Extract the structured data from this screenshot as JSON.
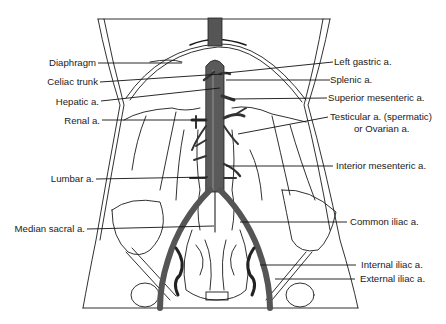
{
  "diagram": {
    "colors": {
      "line": "#1a1a1a",
      "artery": "#555555",
      "artery_dark": "#2a2a2a",
      "background": "#ffffff"
    },
    "labels_left": [
      {
        "text": "Diaphragm"
      },
      {
        "text": "Celiac trunk"
      },
      {
        "text": "Hepatic a."
      },
      {
        "text": "Renal a."
      },
      {
        "text": "Lumbar a."
      },
      {
        "text": "Median sacral a."
      }
    ],
    "labels_right": [
      {
        "text": "Left gastric a."
      },
      {
        "text": "Splenic a."
      },
      {
        "text": "Superior mesenteric a."
      },
      {
        "text": "Testicular a. (spermatic)"
      },
      {
        "text": "or Ovarian a."
      },
      {
        "text": "Interior mesenteric a."
      },
      {
        "text": "Common iliac a."
      },
      {
        "text": "Internal iliac a."
      },
      {
        "text": "External iliac a."
      }
    ]
  }
}
